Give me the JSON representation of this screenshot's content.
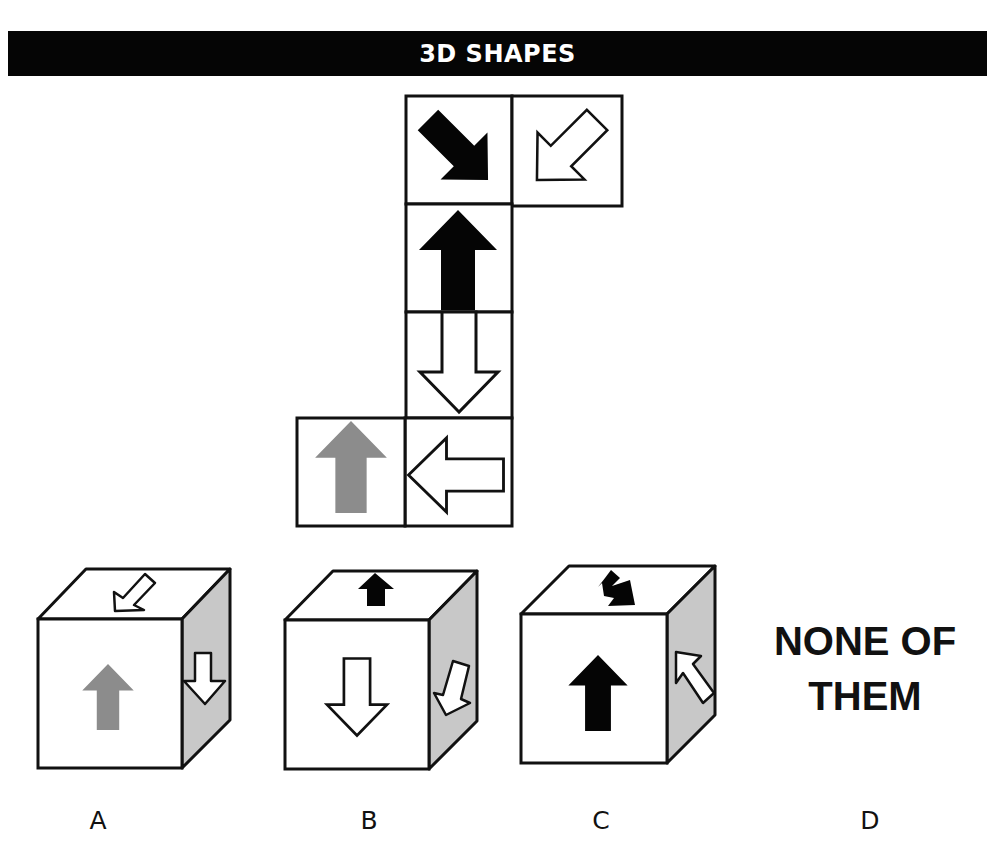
{
  "header": {
    "title": "3D SHAPES"
  },
  "colors": {
    "header_bg": "#050505",
    "header_text": "#ffffff",
    "outline": "#111111",
    "black_arrow": "#050505",
    "white_arrow": "#ffffff",
    "gray_arrow": "#8c8c8c",
    "cube_side_face": "#c8c8c8"
  },
  "net": {
    "description": "Unfolded cube net with six faces",
    "faces": [
      {
        "position": "column-row-1",
        "arrow": "black arrow pointing down-right",
        "icon": "arrow-down-right-icon"
      },
      {
        "position": "right-of-row-1",
        "arrow": "white outlined arrow pointing down-left",
        "icon": "arrow-down-left-icon"
      },
      {
        "position": "column-row-2",
        "arrow": "black arrow pointing up",
        "icon": "arrow-up-icon"
      },
      {
        "position": "column-row-3",
        "arrow": "white outlined arrow pointing down",
        "icon": "arrow-down-icon"
      },
      {
        "position": "column-row-4",
        "arrow": "white outlined arrow pointing left",
        "icon": "arrow-left-icon"
      },
      {
        "position": "left-of-row-4",
        "arrow": "gray arrow pointing up",
        "icon": "arrow-up-icon"
      }
    ]
  },
  "options": [
    {
      "letter": "A",
      "faces": {
        "top": "white outlined arrow pointing down-left",
        "front": "gray arrow pointing up",
        "side": "white outlined arrow pointing down"
      }
    },
    {
      "letter": "B",
      "faces": {
        "top": "black arrow pointing up",
        "front": "white outlined arrow pointing down",
        "side": "white outlined arrow pointing down-left"
      }
    },
    {
      "letter": "C",
      "faces": {
        "top": "black arrow pointing down-right",
        "front": "black arrow pointing up",
        "side": "white outlined arrow pointing up-left"
      }
    },
    {
      "letter": "D",
      "text_line1": "NONE OF",
      "text_line2": "THEM"
    }
  ]
}
